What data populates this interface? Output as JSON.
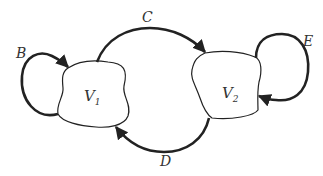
{
  "diagram": {
    "type": "directed-graph",
    "nodes": [
      {
        "id": "V1",
        "label": "V",
        "subscript": "1"
      },
      {
        "id": "V2",
        "label": "V",
        "subscript": "2"
      }
    ],
    "edges": [
      {
        "id": "B",
        "label": "B",
        "from": "V1",
        "to": "V1"
      },
      {
        "id": "C",
        "label": "C",
        "from": "V1",
        "to": "V2"
      },
      {
        "id": "D",
        "label": "D",
        "from": "V2",
        "to": "V1"
      },
      {
        "id": "E",
        "label": "E",
        "from": "V2",
        "to": "V2"
      }
    ],
    "colors": {
      "stroke": "#222222",
      "background": "#ffffff"
    }
  }
}
